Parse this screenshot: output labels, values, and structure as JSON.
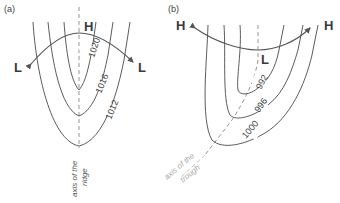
{
  "panel_a": {
    "label": "(a)",
    "high_label": "H",
    "low_left_label": "L",
    "low_right_label": "L",
    "isobars": [
      "1020",
      "1016",
      "1012"
    ],
    "axis_label_line1": "axis of the",
    "axis_label_line2": "ridge"
  },
  "panel_b": {
    "label": "(b)",
    "high_left_label": "H",
    "high_right_label": "H",
    "low_label": "L",
    "isobars": [
      "992",
      "996",
      "1000"
    ],
    "axis_label_line1": "axis of the",
    "axis_label_line2": "trough"
  }
}
